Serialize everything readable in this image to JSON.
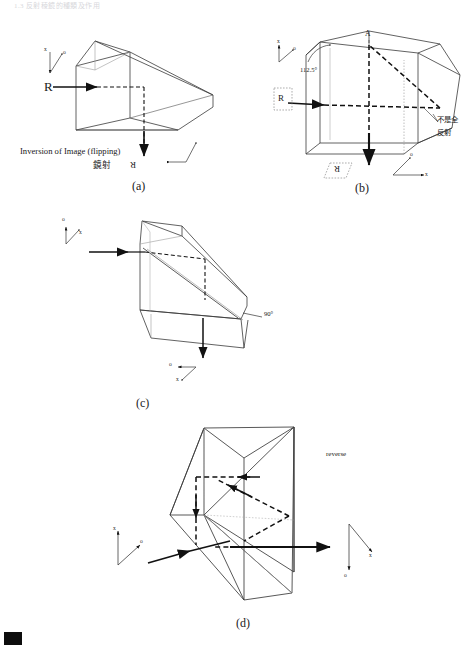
{
  "document": {
    "header_text": "1.3   反射稜鏡的種類及作用",
    "page_width": 471,
    "page_height": 650,
    "line_color": "#333333",
    "dash_color": "#111111",
    "text_color": "#1a1a1a"
  },
  "panels": [
    {
      "id": "a",
      "tag": "(a)",
      "input_ray_label": "R",
      "output_ray_label": "R",
      "caption_en": "Inversion of Image (flipping)",
      "caption_cjk": "鏡射",
      "axis_in": {
        "vertical": "x",
        "diagonal": "o"
      },
      "axis_out": {
        "vertical": "x",
        "diagonal": "o"
      }
    },
    {
      "id": "b",
      "tag": "(b)",
      "input_ray_label": "R",
      "output_ray_label": "R",
      "vertex_label": "A",
      "angle_label": "112.5°",
      "note_cjk_line1": "不是全",
      "note_cjk_line2": "反射",
      "axis_in": {
        "vertical": "x",
        "diagonal": "o"
      },
      "axis_out": {
        "horizontal": "x",
        "diagonal": "o"
      }
    },
    {
      "id": "c",
      "tag": "(c)",
      "angle_label": "90°",
      "axis_in": {
        "vertical": "x",
        "diagonal": "o"
      },
      "axis_out": {
        "horizontal": "o",
        "diagonal": "x"
      }
    },
    {
      "id": "d",
      "tag": "(d)",
      "note_en": "reverse",
      "axis_in": {
        "vertical": "x",
        "diagonal": "o"
      },
      "axis_out": {
        "vertical": "o",
        "diagonal": "x"
      }
    }
  ],
  "corner_mark": {
    "present": true
  }
}
